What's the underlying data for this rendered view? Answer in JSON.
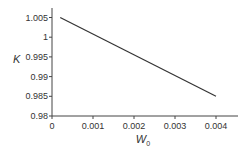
{
  "chart_data": {
    "type": "line",
    "title": "",
    "xlabel": "W0",
    "xlabel_main": "W",
    "xlabel_sub": "0",
    "ylabel": "K",
    "xlim": [
      0,
      0.0045
    ],
    "ylim": [
      0.98,
      1.007
    ],
    "grid": false,
    "legend": null,
    "x_ticks": [
      "0",
      "0.001",
      "0.002",
      "0.003",
      "0.004"
    ],
    "y_ticks": [
      "0.98",
      "0.985",
      "0.99",
      "0.995",
      "1",
      "1.005"
    ],
    "series": [
      {
        "name": "K vs W0",
        "x": [
          0.0002,
          0.004
        ],
        "y": [
          1.005,
          0.985
        ],
        "color": "#333333"
      }
    ]
  }
}
